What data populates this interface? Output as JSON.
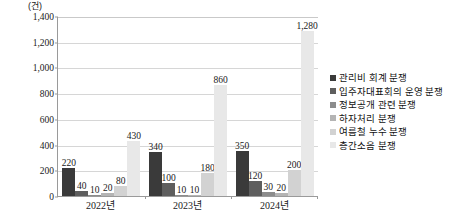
{
  "chart_data": {
    "type": "bar",
    "title": "",
    "subtitle": "",
    "unit_label": "(건)",
    "xlabel": "",
    "ylabel": "",
    "ylim": [
      0,
      1400
    ],
    "ytick_step": 200,
    "grid": true,
    "legend_position": "right",
    "categories": [
      "2022년",
      "2023년",
      "2024년"
    ],
    "ytick_labels": [
      "1,400",
      "1,200",
      "1,000",
      "800",
      "600",
      "400",
      "200",
      "0"
    ],
    "ytick_values": [
      1400,
      1200,
      1000,
      800,
      600,
      400,
      200,
      0
    ],
    "series": [
      {
        "name": "관리비 회계 분쟁",
        "color": "#3a3a3a",
        "values": [
          220,
          340,
          350
        ],
        "labels": [
          "220",
          "340",
          "350"
        ]
      },
      {
        "name": "입주자대표회의 운영 분쟁",
        "color": "#5e5e5e",
        "values": [
          40,
          100,
          120
        ],
        "labels": [
          "40",
          "100",
          "120"
        ]
      },
      {
        "name": "정보공개 관련 분쟁",
        "color": "#8c8c8c",
        "values": [
          10,
          10,
          30
        ],
        "labels": [
          "10",
          "10",
          "30"
        ]
      },
      {
        "name": "하자처리 분쟁",
        "color": "#b4b4b4",
        "values": [
          20,
          10,
          20
        ],
        "labels": [
          "20",
          "10",
          "20"
        ]
      },
      {
        "name": "여름철 누수 분쟁",
        "color": "#d2d2d2",
        "values": [
          80,
          180,
          200
        ],
        "labels": [
          "80",
          "180",
          "200"
        ]
      },
      {
        "name": "층간소음 분쟁",
        "color": "#e8e8e8",
        "values": [
          430,
          860,
          1280
        ],
        "labels": [
          "430",
          "860",
          "1,280"
        ]
      }
    ]
  }
}
